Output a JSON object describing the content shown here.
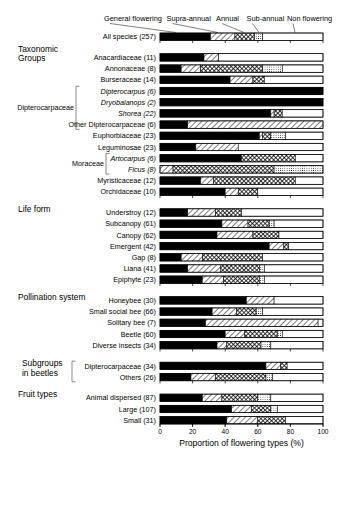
{
  "axis": {
    "title": "Proportion of flowering types (%)",
    "ticks": [
      "0",
      "20",
      "40",
      "60",
      "80",
      "100"
    ],
    "min": 0,
    "max": 100
  },
  "legend": [
    {
      "key": "general_flowering",
      "label": "General flowering",
      "pattern": "solid-black"
    },
    {
      "key": "supra_annual",
      "label": "Supra-annual",
      "pattern": "diagonal-hatch"
    },
    {
      "key": "annual",
      "label": "Annual",
      "pattern": "cross-hatch"
    },
    {
      "key": "sub_annual",
      "label": "Sub-annual",
      "pattern": "fine-dots"
    },
    {
      "key": "non_flowering",
      "label": "Non flowering",
      "pattern": "white"
    }
  ],
  "sections": [
    {
      "name": "",
      "label": ""
    },
    {
      "name": "taxonomic-groups",
      "label": "Taxonomic\nGroups"
    },
    {
      "name": "life-form",
      "label": "Life form"
    },
    {
      "name": "pollination-system",
      "label": "Pollination system"
    },
    {
      "name": "subgroups-in-beetles",
      "label": "Subgroups\nin beetles"
    },
    {
      "name": "fruit-types",
      "label": "Fruit types"
    }
  ],
  "brackets": [
    {
      "name": "dipterocarpaceae-bracket",
      "label": "Dipterocarpaceae"
    },
    {
      "name": "moraceae-bracket",
      "label": "Moraceae"
    },
    {
      "name": "subgroups-bracket",
      "label": "Subgroups\nin beetles"
    }
  ],
  "chart_data": {
    "type": "bar",
    "orientation": "horizontal",
    "stacked": true,
    "normalized_percent": true,
    "title": "",
    "xlabel": "Proportion of flowering types (%)",
    "ylabel": "",
    "xlim": [
      0,
      100
    ],
    "xticks": [
      0,
      20,
      40,
      60,
      80,
      100
    ],
    "grid": false,
    "legend_position": "top",
    "series": [
      {
        "name": "General flowering",
        "pattern": "solid-black"
      },
      {
        "name": "Supra-annual",
        "pattern": "diagonal-hatch"
      },
      {
        "name": "Annual",
        "pattern": "cross-hatch"
      },
      {
        "name": "Sub-annual",
        "pattern": "fine-dots"
      },
      {
        "name": "Non flowering",
        "pattern": "white"
      }
    ],
    "groups": [
      {
        "group": "",
        "rows": [
          {
            "label": "All species (257)",
            "italic": false,
            "values": [
              31,
              15,
              12,
              5,
              37
            ]
          }
        ]
      },
      {
        "group": "Taxonomic Groups",
        "rows": [
          {
            "label": "Anacardiaceae (11)",
            "italic": false,
            "values": [
              27,
              9,
              0,
              0,
              64
            ]
          },
          {
            "label": "Annonaceae (8)",
            "italic": false,
            "values": [
              13,
              12,
              38,
              12,
              25
            ]
          },
          {
            "label": "Burseraceae (14)",
            "italic": false,
            "values": [
              43,
              14,
              7,
              0,
              36
            ]
          },
          {
            "label": "Dipterocarpus (6)",
            "italic": true,
            "values": [
              100,
              0,
              0,
              0,
              0
            ]
          },
          {
            "label": "Dryobalanops (2)",
            "italic": true,
            "values": [
              100,
              0,
              0,
              0,
              0
            ]
          },
          {
            "label": "Shorea (22)",
            "italic": true,
            "values": [
              68,
              2,
              5,
              0,
              25
            ]
          },
          {
            "label": "Other Dipterocarpaceae (6)",
            "italic": false,
            "values": [
              17,
              83,
              0,
              0,
              0
            ]
          },
          {
            "label": "Euphorbiaceae (23)",
            "italic": false,
            "values": [
              61,
              2,
              5,
              9,
              23
            ]
          },
          {
            "label": "Leguminosae (23)",
            "italic": false,
            "values": [
              22,
              26,
              0,
              0,
              52
            ]
          },
          {
            "label": "Artocarpus (6)",
            "italic": true,
            "values": [
              50,
              0,
              33,
              0,
              17
            ]
          },
          {
            "label": "Ficus (8)",
            "italic": true,
            "values": [
              0,
              8,
              62,
              30,
              0
            ]
          },
          {
            "label": "Myristicaceae (12)",
            "italic": false,
            "values": [
              25,
              8,
              50,
              0,
              17
            ]
          },
          {
            "label": "Orchidaceae (10)",
            "italic": false,
            "values": [
              40,
              8,
              12,
              0,
              40
            ]
          }
        ]
      },
      {
        "group": "Life form",
        "rows": [
          {
            "label": "Understroy (12)",
            "italic": false,
            "values": [
              17,
              17,
              16,
              0,
              50
            ]
          },
          {
            "label": "Subcanopy (61)",
            "italic": false,
            "values": [
              38,
              16,
              13,
              3,
              30
            ]
          },
          {
            "label": "Canopy (62)",
            "italic": false,
            "values": [
              35,
              22,
              16,
              0,
              27
            ]
          },
          {
            "label": "Emergent (42)",
            "italic": false,
            "values": [
              67,
              9,
              3,
              0,
              21
            ]
          },
          {
            "label": "Gap (8)",
            "italic": false,
            "values": [
              13,
              13,
              37,
              0,
              37
            ]
          },
          {
            "label": "Liana (41)",
            "italic": false,
            "values": [
              17,
              20,
              24,
              3,
              36
            ]
          },
          {
            "label": "Epiphyte (23)",
            "italic": false,
            "values": [
              26,
              13,
              22,
              3,
              36
            ]
          }
        ]
      },
      {
        "group": "Pollination system",
        "rows": [
          {
            "label": "Honeybee (30)",
            "italic": false,
            "values": [
              53,
              17,
              0,
              0,
              30
            ]
          },
          {
            "label": "Small social bee (66)",
            "italic": false,
            "values": [
              32,
              15,
              12,
              4,
              37
            ]
          },
          {
            "label": "Solitary bee (7)",
            "italic": false,
            "values": [
              28,
              69,
              0,
              0,
              3
            ]
          },
          {
            "label": "Beetle (60)",
            "italic": false,
            "values": [
              40,
              12,
              20,
              3,
              25
            ]
          },
          {
            "label": "Diverse insects (34)",
            "italic": false,
            "values": [
              35,
              6,
              21,
              6,
              32
            ]
          }
        ]
      },
      {
        "group": "Subgroups in beetles",
        "rows": [
          {
            "label": "Dipterocarpaceae (34)",
            "italic": false,
            "values": [
              65,
              9,
              4,
              0,
              22
            ]
          },
          {
            "label": "Others (26)",
            "italic": false,
            "values": [
              19,
              15,
              31,
              4,
              31
            ]
          }
        ]
      },
      {
        "group": "Fruit types",
        "rows": [
          {
            "label": "Animal dispersed (87)",
            "italic": false,
            "values": [
              26,
              12,
              22,
              8,
              32
            ]
          },
          {
            "label": "Large (107)",
            "italic": false,
            "values": [
              44,
              12,
              12,
              4,
              28
            ]
          },
          {
            "label": "Small (31)",
            "italic": false,
            "values": [
              41,
              19,
              17,
              0,
              23
            ]
          }
        ]
      }
    ]
  }
}
